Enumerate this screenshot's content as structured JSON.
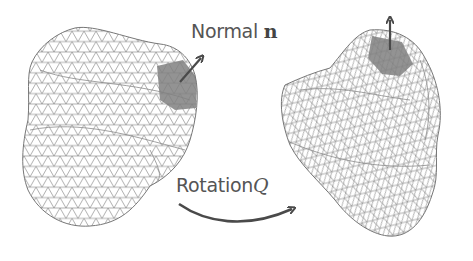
{
  "figure": {
    "labels": {
      "normal_text": "Normal",
      "normal_symbol": "n",
      "rotation_text": "Rotation",
      "rotation_symbol": "Q"
    },
    "colors": {
      "background": "#ffffff",
      "mesh_line": "#7a7a7a",
      "patch_fill": "#808080",
      "arrow": "#4a4a4a",
      "text": "#555555"
    },
    "panels": [
      {
        "name": "original-mesh",
        "description": "triangulated surface mesh, highlighted patch with normal arrow pointing up-right"
      },
      {
        "name": "rotated-mesh",
        "description": "same mesh after rotation Q, highlighted patch with normal arrow pointing straight up"
      }
    ]
  }
}
